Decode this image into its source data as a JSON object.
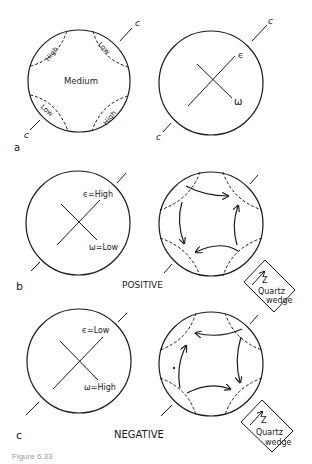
{
  "panels": {
    "a": {
      "label": "a",
      "left_circle": {
        "regions": {
          "center": "Medium",
          "top_left": "High",
          "top_right": "Low",
          "bottom_left": "Low",
          "bottom_right": "High"
        },
        "axis_label_top": "c",
        "axis_label_bottom": "c"
      },
      "right_circle": {
        "epsilon": "ϵ",
        "omega": "ω",
        "axis_label_top": "c",
        "axis_label_bottom": "c"
      }
    },
    "b": {
      "label": "b",
      "left_circle": {
        "epsilon": "ϵ=High",
        "omega": "ω=Low"
      },
      "sign": "POSITIVE",
      "wedge": {
        "axis": "Z",
        "line1": "Quartz",
        "line2": "wedge"
      }
    },
    "c": {
      "label": "c",
      "left_circle": {
        "epsilon": "ϵ=Low",
        "omega": "ω=High"
      },
      "sign": "NEGATIVE",
      "wedge": {
        "axis": "Z",
        "line1": "Quartz",
        "line2": "wedge"
      }
    }
  },
  "caption": "Figure 6.33"
}
